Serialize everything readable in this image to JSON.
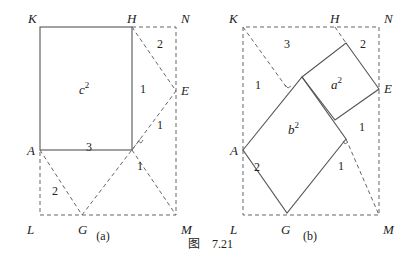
{
  "figure": {
    "caption_prefix": "图",
    "caption_number": "7.21"
  },
  "panel_a": {
    "label": "(a)",
    "points": {
      "K": "K",
      "H": "H",
      "N": "N",
      "E": "E",
      "A": "A",
      "L": "L",
      "G": "G",
      "M": "M"
    },
    "square_label": "c",
    "square_exp": "2",
    "regions": {
      "r1": "2",
      "r2": "1",
      "r3": "1",
      "r4": "3",
      "r5": "2",
      "r6": "1"
    }
  },
  "panel_b": {
    "label": "(b)",
    "points": {
      "K": "K",
      "H": "H",
      "N": "N",
      "E": "E",
      "A": "A",
      "L": "L",
      "G": "G",
      "M": "M"
    },
    "square_a_label": "a",
    "square_a_exp": "2",
    "square_b_label": "b",
    "square_b_exp": "2",
    "regions": {
      "r1": "3",
      "r2": "2",
      "r3": "1",
      "r4": "1",
      "r5": "2",
      "r6": "1"
    }
  }
}
